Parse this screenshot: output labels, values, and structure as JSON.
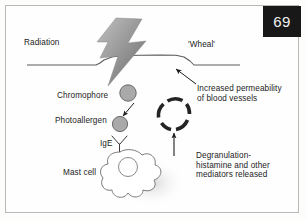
{
  "figure": {
    "page_number": "69",
    "background_color": "#fdfdfc",
    "border_color": "#b9b9b9",
    "badge_bg_color": "#181818",
    "badge_text_color": "#f2f2f2",
    "ink_color": "#1b1b1b"
  },
  "labels": {
    "radiation": "Radiation",
    "wheal": "'Wheal'",
    "increased_permeability_line1": "Increased permeability",
    "increased_permeability_line2": "of blood vessels",
    "chromophore": "Chromophore",
    "photoallergen": "Photoallergen",
    "ige": "IgE",
    "mast_cell": "Mast cell",
    "degranulation_line1": "Degranulation-",
    "degranulation_line2": "histamine and other",
    "degranulation_line3": "mediators released"
  },
  "graphics": {
    "lightning_bolt": {
      "name": "radiation-lightning-bolt",
      "fill_light": "#b5b5b5",
      "fill_dark": "#6e6e6e"
    },
    "skin_line": {
      "name": "skin-surface-line",
      "color": "#4a4a4a"
    },
    "wheal_bump": {
      "name": "wheal-swelling-bump"
    },
    "chromophore_circle": {
      "name": "chromophore-particle",
      "fill": "#a9a9a9",
      "stroke": "#6b6b6b"
    },
    "photoallergen_circle": {
      "name": "photoallergen-particle",
      "fill": "#a9a9a9",
      "stroke": "#6b6b6b"
    },
    "conversion_arrow": {
      "name": "chromophore-to-photoallergen-arrow"
    },
    "ige_receptor": {
      "name": "ige-antibody-receptor"
    },
    "mast_cell_body": {
      "name": "mast-cell-outline"
    },
    "mast_cell_nucleus": {
      "name": "mast-cell-nucleus"
    },
    "blood_vessel_ring": {
      "name": "blood-vessel-cross-section",
      "color": "#2b2b2b"
    },
    "degranulation_arrow": {
      "name": "degranulation-upward-arrow"
    },
    "wheal_pointer_arrow": {
      "name": "wheal-pointer-arrow"
    }
  }
}
